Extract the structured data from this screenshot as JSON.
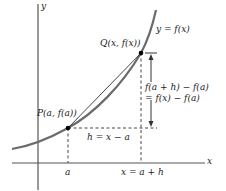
{
  "diagram": {
    "axes": {
      "x_label": "x",
      "y_label": "y"
    },
    "curve_label": "y = f(x)",
    "points": {
      "P": {
        "label": "P(a, f(a))"
      },
      "Q": {
        "label": "Q(x, f(x))"
      }
    },
    "x_ticks": {
      "a": "a",
      "x": "x = a + h"
    },
    "horizontal_span_label": "h = x − a",
    "vertical_span_label_1": "f(a + h) − f(a)",
    "vertical_span_label_2": "= f(x) − f(a)",
    "colors": {
      "curve": "#6b6b6b",
      "axes": "#555555",
      "secant": "#333333",
      "dashes": "#444444",
      "points": "#000000"
    }
  }
}
